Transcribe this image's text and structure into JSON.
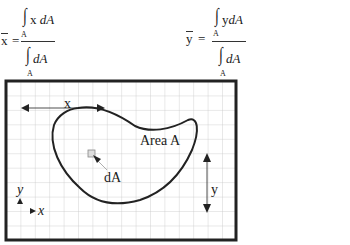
{
  "formulas": {
    "x_bar": {
      "lhs": "x",
      "equals": "=",
      "numerator": "x dA",
      "numerator_parts": [
        "x",
        "dA"
      ],
      "denominator": "dA",
      "limit": "A"
    },
    "y_bar": {
      "lhs": "y",
      "equals": "=",
      "numerator": "ydA",
      "numerator_parts": [
        "y",
        "dA"
      ],
      "denominator": "dA",
      "limit": "A"
    }
  },
  "diagram": {
    "area_label": "Area A",
    "element_label": "dA",
    "x_distance_label": "x",
    "y_distance_label": "y",
    "axis_x_label": "x",
    "axis_y_label": "y",
    "grid": {
      "columns": 16,
      "rows": 11,
      "line_color": "#c8c8c8",
      "border_color": "#222222"
    }
  }
}
